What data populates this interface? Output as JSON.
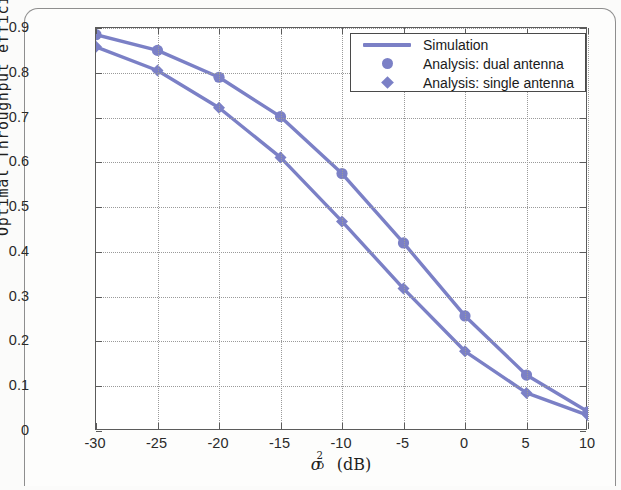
{
  "chart_data": {
    "type": "line",
    "title": "",
    "xlabel": "σ²_D (dB)",
    "ylabel": "Optimal Throughput efficiency - τ",
    "x": [
      -30,
      -25,
      -20,
      -15,
      -10,
      -5,
      0,
      5,
      10
    ],
    "xlim": [
      -30,
      10
    ],
    "ylim": [
      0,
      0.9
    ],
    "xticks": [
      "-30",
      "-25",
      "-20",
      "-15",
      "-10",
      "-5",
      "0",
      "5",
      "10"
    ],
    "yticks": [
      "0",
      "0.1",
      "0.2",
      "0.3",
      "0.4",
      "0.5",
      "0.6",
      "0.7",
      "0.8",
      "0.9"
    ],
    "grid": true,
    "legend_position": "top-right",
    "series": [
      {
        "name": "Analysis: dual antenna",
        "marker": "circle",
        "color": "#7b80c6",
        "values": [
          0.885,
          0.85,
          0.79,
          0.702,
          0.575,
          0.42,
          0.257,
          0.125,
          0.043
        ]
      },
      {
        "name": "Analysis: single antenna",
        "marker": "diamond",
        "color": "#7b80c6",
        "values": [
          0.858,
          0.805,
          0.722,
          0.611,
          0.468,
          0.318,
          0.178,
          0.085,
          0.035
        ]
      }
    ],
    "legend": [
      {
        "label": "Simulation",
        "key": "line"
      },
      {
        "label": "Analysis: dual antenna",
        "key": "circle"
      },
      {
        "label": "Analysis: single antenna",
        "key": "diamond"
      }
    ]
  },
  "axis": {
    "ylabel_text": "Optimal Throughput efficiency - τ",
    "xlabel_sigma": "σ",
    "xlabel_sup": "2",
    "xlabel_sub": "D",
    "xlabel_unit": "(dB)"
  }
}
